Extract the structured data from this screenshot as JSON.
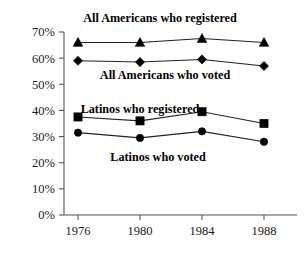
{
  "chart_data": {
    "type": "line",
    "title": "",
    "xlabel": "",
    "ylabel": "",
    "categories": [
      "1976",
      "1980",
      "1984",
      "1988"
    ],
    "ylim": [
      0,
      70
    ],
    "ytick_labels": [
      "0%",
      "10%",
      "20%",
      "30%",
      "40%",
      "50%",
      "60%",
      "70%"
    ],
    "ytick_values": [
      0,
      10,
      20,
      30,
      40,
      50,
      60,
      70
    ],
    "grid": false,
    "legend_position": "inline-annotations",
    "series": [
      {
        "name": "All Americans who registered",
        "marker": "triangle",
        "values": [
          66.0,
          66.0,
          67.5,
          66.0
        ]
      },
      {
        "name": "All Americans who voted",
        "marker": "diamond",
        "values": [
          59.0,
          58.5,
          59.5,
          57.0
        ]
      },
      {
        "name": "Latinos who registered",
        "marker": "square",
        "values": [
          37.5,
          36.0,
          39.5,
          35.0
        ]
      },
      {
        "name": "Latinos who voted",
        "marker": "circle",
        "values": [
          31.5,
          29.5,
          32.0,
          28.0
        ]
      }
    ],
    "annotations": [
      {
        "text": "All Americans who registered",
        "x": 160,
        "y": 22,
        "anchor": "middle"
      },
      {
        "text": "All Americans who voted",
        "x": 165,
        "y": 79,
        "anchor": "middle"
      },
      {
        "text": "Latinos who registered",
        "x": 140,
        "y": 113,
        "anchor": "middle"
      },
      {
        "text": "Latinos who voted",
        "x": 158,
        "y": 161,
        "anchor": "middle"
      }
    ],
    "colors": {
      "series": "#000000",
      "axis": "#555555",
      "background": "#ffffff"
    }
  }
}
